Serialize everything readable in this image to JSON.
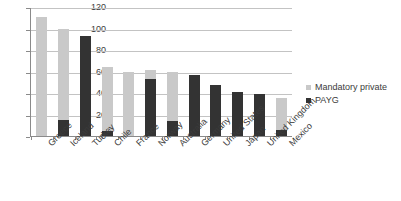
{
  "chart_data": {
    "type": "bar",
    "stacked": true,
    "title": "",
    "xlabel": "",
    "ylabel": "",
    "ylim": [
      0,
      120
    ],
    "yticks": [
      0,
      20,
      40,
      60,
      80,
      100,
      120
    ],
    "grid": true,
    "legend_position": "right",
    "categories": [
      "Greece",
      "Iceland",
      "Turkey",
      "Chile",
      "France",
      "Norway",
      "Australia",
      "Germany",
      "United States",
      "Japan",
      "United Kingdom",
      "Mexico"
    ],
    "series": [
      {
        "name": "PAYG",
        "color": "#333333",
        "values": [
          0,
          15,
          93,
          5,
          0,
          53,
          14,
          57,
          47,
          41,
          39,
          6
        ]
      },
      {
        "name": "Mandatory private",
        "color": "#c9c9c9",
        "values": [
          111,
          85,
          0,
          59,
          60,
          8,
          46,
          0,
          0,
          0,
          0,
          29
        ]
      }
    ],
    "totals": [
      111,
      100,
      93,
      64,
      60,
      61,
      60,
      57,
      47,
      41,
      39,
      35
    ]
  },
  "legend": {
    "entries": [
      {
        "label": "Mandatory private",
        "color": "#c9c9c9"
      },
      {
        "label": "PAYG",
        "color": "#333333"
      }
    ]
  }
}
